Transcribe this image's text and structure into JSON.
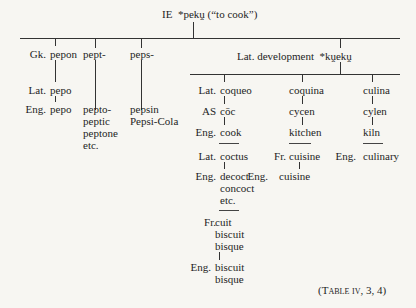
{
  "root": {
    "label": "IE",
    "form": "*pekṷ",
    "gloss": "(“to cook”)"
  },
  "branches": {
    "greek": {
      "gk": {
        "lang": "Gk.",
        "form": "pepon"
      },
      "lat": {
        "lang": "Lat.",
        "form": "pepo"
      },
      "eng": {
        "lang": "Eng.",
        "form": "pepo"
      }
    },
    "pept": {
      "stem": "pept-",
      "derivatives": "pepto-\npeptic\npeptone\netc."
    },
    "peps": {
      "stem": "peps-",
      "derivatives": "pepsin\nPepsi-Cola"
    },
    "latin_dev": {
      "label": "Lat. development",
      "form": "*kṷekṷ",
      "coqueo": {
        "lat": {
          "lang": "Lat.",
          "form": "coqueo"
        },
        "as": {
          "lang": "AS",
          "form": "cōc"
        },
        "eng": {
          "lang": "Eng.",
          "form": "cook"
        },
        "lat2": {
          "lang": "Lat.",
          "form": "coctus"
        },
        "eng2": {
          "lang": "Eng.",
          "form": "decoct\nconcoct\netc."
        },
        "fr": {
          "lang": "Fr.",
          "form": "cuit\nbiscuit\nbisque"
        },
        "eng3": {
          "lang": "Eng.",
          "form": "biscuit\nbisque"
        }
      },
      "coquina": {
        "lat": {
          "form": "coquina"
        },
        "as": {
          "form": "cycen"
        },
        "eng": {
          "form": "kitchen"
        },
        "fr": {
          "lang": "Fr.",
          "form": "cuisine"
        },
        "eng2": {
          "lang": "Eng.",
          "form": "cuisine"
        }
      },
      "culina": {
        "lat": {
          "form": "culina"
        },
        "as": {
          "form": "cylen"
        },
        "eng": {
          "form": "kiln"
        },
        "eng2": {
          "lang": "Eng.",
          "form": "culinary"
        }
      }
    }
  },
  "caption": {
    "open": "(",
    "table": "Table iv",
    "refs": ", 3, 4)"
  }
}
